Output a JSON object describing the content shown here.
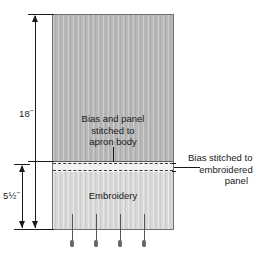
{
  "diagram": {
    "colors": {
      "apron_panel": "#b8b8b8",
      "embroidered_panel": "#d8d8d8",
      "bias_strip": "#f2f2f2",
      "line": "#1a1a1a",
      "panel_border": "#6e6e6e",
      "pin": "#6b6b6b"
    },
    "dimensions": [
      {
        "name": "overall-height",
        "label": "18˝"
      },
      {
        "name": "embroidery-height",
        "label": "5½˝"
      }
    ],
    "panels": {
      "apron_body": {
        "label_lines": [
          "Bias and panel",
          "stitched to",
          "apron body"
        ]
      },
      "embroidered": {
        "label": "Embroidery"
      }
    },
    "callouts": [
      {
        "name": "bias-stitched-callout",
        "lines": [
          "Bias stitched to",
          "embroidered",
          "panel"
        ]
      }
    ],
    "pins": {
      "count": 4,
      "positions": [
        70,
        94,
        118,
        142
      ]
    }
  }
}
